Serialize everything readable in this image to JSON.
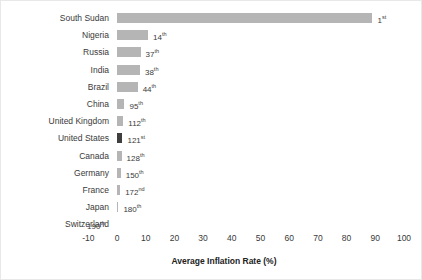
{
  "chart_data": {
    "type": "bar",
    "orientation": "horizontal",
    "title": "",
    "xlabel": "Average Inflation Rate (%)",
    "ylabel": "",
    "xlim": [
      -10,
      100
    ],
    "xticks": [
      -10,
      0,
      10,
      20,
      30,
      40,
      50,
      60,
      70,
      80,
      90,
      100
    ],
    "xtick_labels": [
      "-10",
      "0",
      "10",
      "20",
      "30",
      "40",
      "50",
      "60",
      "70",
      "80",
      "90",
      "100"
    ],
    "grid": false,
    "legend": "none",
    "categories": [
      "South Sudan",
      "Nigeria",
      "Russia",
      "India",
      "Brazil",
      "China",
      "United Kingdom",
      "United States",
      "Canada",
      "Germany",
      "France",
      "Japan",
      "Switzerland"
    ],
    "values": [
      89.0,
      10.8,
      8.2,
      8.0,
      7.2,
      2.6,
      2.2,
      1.9,
      1.6,
      1.3,
      1.1,
      0.5,
      -0.2
    ],
    "data_labels": [
      "1st",
      "14th",
      "37th",
      "38th",
      "44th",
      "95th",
      "112th",
      "121st",
      "128th",
      "150th",
      "172nd",
      "180th",
      "190th"
    ],
    "series": [
      {
        "name": "Average Inflation Rate (%)",
        "values": [
          89.0,
          10.8,
          8.2,
          8.0,
          7.2,
          2.6,
          2.2,
          1.9,
          1.6,
          1.3,
          1.1,
          0.5,
          -0.2
        ]
      }
    ],
    "bars": [
      {
        "category": "South Sudan",
        "value": 89.0,
        "rank_number": "1",
        "rank_suffix": "st",
        "rank_label": "1st",
        "highlight": false
      },
      {
        "category": "Nigeria",
        "value": 10.8,
        "rank_number": "14",
        "rank_suffix": "th",
        "rank_label": "14th",
        "highlight": false
      },
      {
        "category": "Russia",
        "value": 8.2,
        "rank_number": "37",
        "rank_suffix": "th",
        "rank_label": "37th",
        "highlight": false
      },
      {
        "category": "India",
        "value": 8.0,
        "rank_number": "38",
        "rank_suffix": "th",
        "rank_label": "38th",
        "highlight": false
      },
      {
        "category": "Brazil",
        "value": 7.2,
        "rank_number": "44",
        "rank_suffix": "th",
        "rank_label": "44th",
        "highlight": false
      },
      {
        "category": "China",
        "value": 2.6,
        "rank_number": "95",
        "rank_suffix": "th",
        "rank_label": "95th",
        "highlight": false
      },
      {
        "category": "United Kingdom",
        "value": 2.2,
        "rank_number": "112",
        "rank_suffix": "th",
        "rank_label": "112th",
        "highlight": false
      },
      {
        "category": "United States",
        "value": 1.9,
        "rank_number": "121",
        "rank_suffix": "st",
        "rank_label": "121st",
        "highlight": true
      },
      {
        "category": "Canada",
        "value": 1.6,
        "rank_number": "128",
        "rank_suffix": "th",
        "rank_label": "128th",
        "highlight": false
      },
      {
        "category": "Germany",
        "value": 1.3,
        "rank_number": "150",
        "rank_suffix": "th",
        "rank_label": "150th",
        "highlight": false
      },
      {
        "category": "France",
        "value": 1.1,
        "rank_number": "172",
        "rank_suffix": "nd",
        "rank_label": "172nd",
        "highlight": false
      },
      {
        "category": "Japan",
        "value": 0.5,
        "rank_number": "180",
        "rank_suffix": "th",
        "rank_label": "180th",
        "highlight": false
      },
      {
        "category": "Switzerland",
        "value": -0.2,
        "rank_number": "190",
        "rank_suffix": "th",
        "rank_label": "190th",
        "highlight": false
      }
    ],
    "colors": {
      "bar": "#b5b5b5",
      "highlight_bar": "#3f3f3f",
      "text": "#3a3a3a",
      "background": "#ffffff",
      "border": "#e8e8e8"
    }
  }
}
